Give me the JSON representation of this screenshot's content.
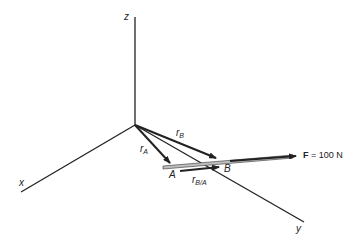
{
  "diagram": {
    "axes": {
      "x": "x",
      "y": "y",
      "z": "z"
    },
    "points": {
      "A": "A",
      "B": "B"
    },
    "vectors": {
      "rA": {
        "main": "r",
        "sub": "A"
      },
      "rB": {
        "main": "r",
        "sub": "B"
      },
      "rBA": {
        "main": "r",
        "sub": "B/A"
      }
    },
    "force": {
      "symbol": "F",
      "value": " = 100 N"
    },
    "colors": {
      "line": "#222222",
      "bar_fill": "#bfbfbf"
    }
  }
}
